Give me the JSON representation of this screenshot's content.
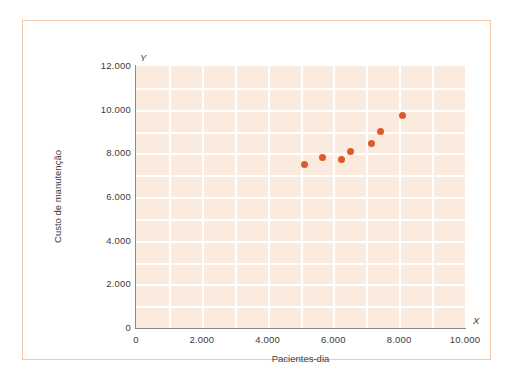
{
  "chart_data": {
    "type": "scatter",
    "title": "",
    "subtitle": "",
    "xlabel": "Pacientes-dia",
    "ylabel": "Custo de manutenção",
    "x_axis_letter": "X",
    "y_axis_letter": "Y",
    "xlim": [
      0,
      10000
    ],
    "ylim": [
      0,
      12000
    ],
    "x_ticks": [
      0,
      2000,
      4000,
      6000,
      8000,
      10000
    ],
    "y_ticks": [
      0,
      2000,
      4000,
      6000,
      8000,
      10000,
      12000
    ],
    "x_tick_labels": [
      "0",
      "2.000",
      "4.000",
      "6.000",
      "8.000",
      "10.000"
    ],
    "y_tick_labels": [
      "0",
      "2.000",
      "4.000",
      "6.000",
      "8.000",
      "10.000",
      "12.000"
    ],
    "x_gridline_step": 1000,
    "y_gridline_step": 1000,
    "grid": true,
    "legend": null,
    "annotations": [],
    "marker_color": "#dd5a2c",
    "plot_background_color": "#fbebdf",
    "gridline_color": "#ffffff",
    "frame_border_color": "#f2c9ab",
    "axis_line_color": "#8a8a86",
    "points": [
      {
        "x": 5130,
        "y": 7500
      },
      {
        "x": 5660,
        "y": 7830
      },
      {
        "x": 6240,
        "y": 7710
      },
      {
        "x": 6510,
        "y": 8080
      },
      {
        "x": 7170,
        "y": 8440
      },
      {
        "x": 7420,
        "y": 8990
      },
      {
        "x": 8090,
        "y": 9710
      }
    ]
  }
}
